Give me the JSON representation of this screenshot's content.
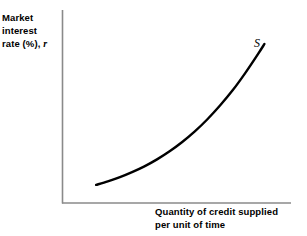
{
  "figure": {
    "background_color": "#ffffff",
    "width": 307,
    "height": 236
  },
  "axes": {
    "color": "#8a8a8a",
    "origin_x": 62,
    "origin_y": 203,
    "y_axis_top": 10,
    "x_axis_right": 291,
    "y_label": {
      "line1": "Market",
      "line2": "interest",
      "line3_prefix": "rate (%), ",
      "line3_symbol": "r"
    },
    "x_label": {
      "line1": "Quantity of credit supplied",
      "line2": "per unit of time"
    }
  },
  "curve": {
    "name": "supply-curve",
    "label": "S",
    "color": "#000000",
    "stroke_width": 2.4
  },
  "chart_data": {
    "type": "line",
    "title": "",
    "xlabel": "Quantity of credit supplied per unit of time",
    "ylabel": "Market interest rate (%), r",
    "grid": false,
    "legend": "none",
    "annotations": [
      {
        "text": "S",
        "x": 0.885,
        "y": 0.9
      }
    ],
    "xlim": [
      0,
      1
    ],
    "ylim": [
      0,
      1
    ],
    "series": [
      {
        "name": "S",
        "description": "Upward-sloping convex credit supply curve",
        "x": [
          0.149,
          0.2,
          0.253,
          0.306,
          0.36,
          0.415,
          0.47,
          0.525,
          0.58,
          0.635,
          0.69,
          0.746,
          0.8,
          0.855,
          0.884
        ],
        "y": [
          0.094,
          0.112,
          0.134,
          0.16,
          0.19,
          0.226,
          0.268,
          0.316,
          0.371,
          0.434,
          0.505,
          0.585,
          0.673,
          0.77,
          0.824
        ]
      }
    ]
  }
}
